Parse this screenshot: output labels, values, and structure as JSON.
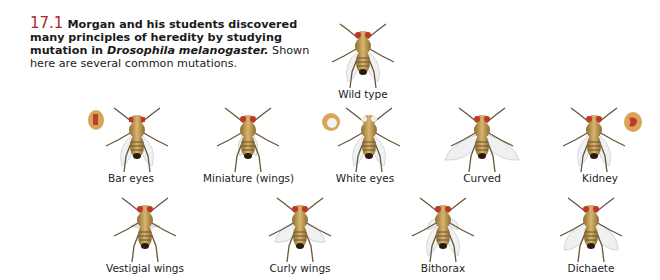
{
  "figure": {
    "number": "17.1",
    "title_bold": "Morgan and his students discovered many principles of heredity by studying mutation in ",
    "species_italic": "Drosophila melanogaster.",
    "description": " Shown here are several common mutations.",
    "colors": {
      "figure_number": "#b0291f",
      "text": "#1a1a1a"
    }
  },
  "flies": [
    {
      "id": "wild-type",
      "label": "Wild type",
      "wings": "normal",
      "eyes": "red"
    },
    {
      "id": "bar-eyes",
      "label": "Bar eyes",
      "wings": "normal",
      "eyes": "bar",
      "inset": "left"
    },
    {
      "id": "miniature",
      "label": "Miniature (wings)",
      "wings": "small",
      "eyes": "red"
    },
    {
      "id": "white-eyes",
      "label": "White eyes",
      "wings": "normal",
      "eyes": "white",
      "inset": "left"
    },
    {
      "id": "curved",
      "label": "Curved",
      "wings": "curved",
      "eyes": "red"
    },
    {
      "id": "kidney",
      "label": "Kidney",
      "wings": "normal",
      "eyes": "kidney",
      "inset": "right"
    },
    {
      "id": "vestigial",
      "label": "Vestigial wings",
      "wings": "vestigial",
      "eyes": "red"
    },
    {
      "id": "curly",
      "label": "Curly wings",
      "wings": "curly",
      "eyes": "red"
    },
    {
      "id": "bithorax",
      "label": "Bithorax",
      "wings": "double",
      "eyes": "red"
    },
    {
      "id": "dichaete",
      "label": "Dichaete",
      "wings": "spread",
      "eyes": "red"
    }
  ]
}
